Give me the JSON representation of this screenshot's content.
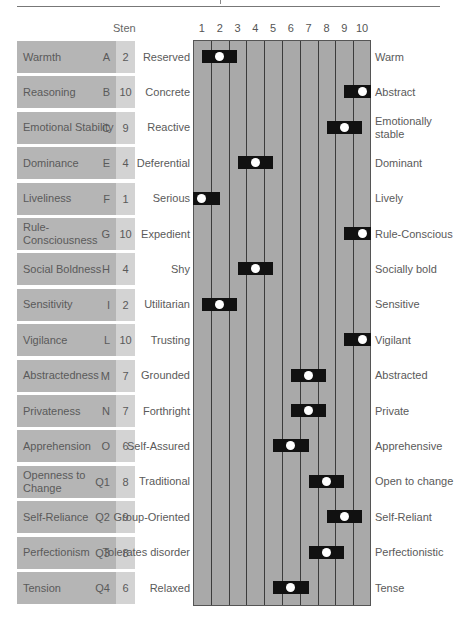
{
  "header": {
    "sten_label": "Sten"
  },
  "scale": {
    "ticks": [
      "1",
      "2",
      "3",
      "4",
      "5",
      "6",
      "7",
      "8",
      "9",
      "10"
    ]
  },
  "colors": {
    "grid_fill": "#a9a9a9",
    "grid_line": "#3c3c3c",
    "bar": "#111111",
    "dot": "#ffffff",
    "label_cell": "#b5b5b5",
    "sten_cell": "#d3d3d3"
  },
  "factors": [
    {
      "name": "Warmth",
      "code": "A",
      "sten": "2",
      "low": "Reserved",
      "high": "Warm"
    },
    {
      "name": "Reasoning",
      "code": "B",
      "sten": "10",
      "low": "Concrete",
      "high": "Abstract"
    },
    {
      "name": "Emotional Stability",
      "code": "C",
      "sten": "9",
      "low": "Reactive",
      "high": "Emotionally stable"
    },
    {
      "name": "Dominance",
      "code": "E",
      "sten": "4",
      "low": "Deferential",
      "high": "Dominant"
    },
    {
      "name": "Liveliness",
      "code": "F",
      "sten": "1",
      "low": "Serious",
      "high": "Lively"
    },
    {
      "name": "Rule-Consciousness",
      "code": "G",
      "sten": "10",
      "low": "Expedient",
      "high": "Rule-Conscious"
    },
    {
      "name": "Social Boldness",
      "code": "H",
      "sten": "4",
      "low": "Shy",
      "high": "Socially bold"
    },
    {
      "name": "Sensitivity",
      "code": "I",
      "sten": "2",
      "low": "Utilitarian",
      "high": "Sensitive"
    },
    {
      "name": "Vigilance",
      "code": "L",
      "sten": "10",
      "low": "Trusting",
      "high": "Vigilant"
    },
    {
      "name": "Abstractedness",
      "code": "M",
      "sten": "7",
      "low": "Grounded",
      "high": "Abstracted"
    },
    {
      "name": "Privateness",
      "code": "N",
      "sten": "7",
      "low": "Forthright",
      "high": "Private"
    },
    {
      "name": "Apprehension",
      "code": "O",
      "sten": "6",
      "low": "Self-Assured",
      "high": "Apprehensive"
    },
    {
      "name": "Openness to Change",
      "code": "Q1",
      "sten": "8",
      "low": "Traditional",
      "high": "Open to change"
    },
    {
      "name": "Self-Reliance",
      "code": "Q2",
      "sten": "9",
      "low": "Group-Oriented",
      "high": "Self-Reliant"
    },
    {
      "name": "Perfectionism",
      "code": "Q3",
      "sten": "8",
      "low": "Tolerates disorder",
      "high": "Perfectionistic"
    },
    {
      "name": "Tension",
      "code": "Q4",
      "sten": "6",
      "low": "Relaxed",
      "high": "Tense"
    }
  ],
  "chart_data": {
    "type": "scatter",
    "xlabel": "Sten",
    "ylabel": "",
    "xlim": [
      1,
      10
    ],
    "x_ticks": [
      1,
      2,
      3,
      4,
      5,
      6,
      7,
      8,
      9,
      10
    ],
    "grid": true,
    "categories": [
      "Warmth (A)",
      "Reasoning (B)",
      "Emotional Stability (C)",
      "Dominance (E)",
      "Liveliness (F)",
      "Rule-Consciousness (G)",
      "Social Boldness (H)",
      "Sensitivity (I)",
      "Vigilance (L)",
      "Abstractedness (M)",
      "Privateness (N)",
      "Apprehension (O)",
      "Openness to Change (Q1)",
      "Self-Reliance (Q2)",
      "Perfectionism (Q3)",
      "Tension (Q4)"
    ],
    "values": [
      2,
      10,
      9,
      4,
      1,
      10,
      4,
      2,
      10,
      7,
      7,
      6,
      8,
      9,
      8,
      6
    ],
    "error_band": 1,
    "left_poles": [
      "Reserved",
      "Concrete",
      "Reactive",
      "Deferential",
      "Serious",
      "Expedient",
      "Shy",
      "Utilitarian",
      "Trusting",
      "Grounded",
      "Forthright",
      "Self-Assured",
      "Traditional",
      "Group-Oriented",
      "Tolerates disorder",
      "Relaxed"
    ],
    "right_poles": [
      "Warm",
      "Abstract",
      "Emotionally stable",
      "Dominant",
      "Lively",
      "Rule-Conscious",
      "Socially bold",
      "Sensitive",
      "Vigilant",
      "Abstracted",
      "Private",
      "Apprehensive",
      "Open to change",
      "Self-Reliant",
      "Perfectionistic",
      "Tense"
    ]
  }
}
